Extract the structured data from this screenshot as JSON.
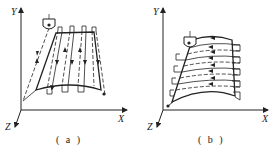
{
  "figures": [
    {
      "id": "a",
      "caption": "( a )",
      "description": "Vertical zig-zag tool path on curved surface",
      "axes": {
        "x": "X",
        "y": "Y",
        "z": "Z"
      }
    },
    {
      "id": "b",
      "caption": "( b )",
      "description": "Horizontal zig-zag tool path on curved surface",
      "axes": {
        "x": "X",
        "y": "Y",
        "z": "Z"
      }
    }
  ],
  "colors": {
    "line": "#222222",
    "background": "#ffffff"
  }
}
